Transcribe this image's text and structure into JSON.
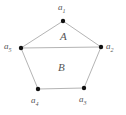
{
  "figure": {
    "type": "pentagon-partition-diagram",
    "canvas": {
      "width": 126,
      "height": 115,
      "background": "#ffffff"
    },
    "style": {
      "edge_color": "#b4b4b4",
      "edge_width": 1,
      "vertex_color": "#111111",
      "vertex_radius": 2.2,
      "label_color": "#555555"
    },
    "vertices": [
      {
        "id": "a1",
        "label": "a",
        "sub": "1",
        "x": 63,
        "y": 21,
        "label_x": 58,
        "label_y": 3
      },
      {
        "id": "a2",
        "label": "a",
        "sub": "2",
        "x": 101,
        "y": 47,
        "label_x": 106,
        "label_y": 42
      },
      {
        "id": "a3",
        "label": "a",
        "sub": "3",
        "x": 84,
        "y": 88,
        "label_x": 79,
        "label_y": 95
      },
      {
        "id": "a4",
        "label": "a",
        "sub": "4",
        "x": 38,
        "y": 89,
        "label_x": 31,
        "label_y": 96
      },
      {
        "id": "a5",
        "label": "a",
        "sub": "5",
        "x": 21,
        "y": 48,
        "label_x": 4,
        "label_y": 42
      }
    ],
    "edges": [
      {
        "id": "edge-a1-a2",
        "from": "a1",
        "to": "a2"
      },
      {
        "id": "edge-a2-a3",
        "from": "a2",
        "to": "a3"
      },
      {
        "id": "edge-a3-a4",
        "from": "a3",
        "to": "a4"
      },
      {
        "id": "edge-a4-a5",
        "from": "a4",
        "to": "a5"
      },
      {
        "id": "edge-a5-a1",
        "from": "a5",
        "to": "a1"
      },
      {
        "id": "edge-a5-a2-diagonal",
        "from": "a5",
        "to": "a2"
      }
    ],
    "regions": [
      {
        "id": "region-A",
        "label": "A",
        "x": 60,
        "y": 31,
        "bounded_by": [
          "a1",
          "a2",
          "a5"
        ]
      },
      {
        "id": "region-B",
        "label": "B",
        "x": 58,
        "y": 62,
        "bounded_by": [
          "a5",
          "a2",
          "a3",
          "a4"
        ]
      }
    ]
  }
}
